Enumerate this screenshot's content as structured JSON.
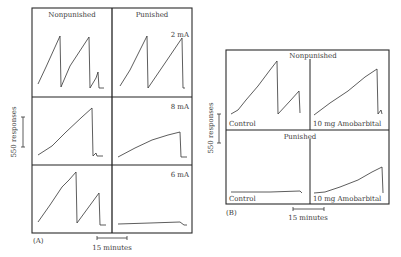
{
  "figure": {
    "panel_a": {
      "tag": "(A)",
      "col_headers": [
        "Nonpunished",
        "Punished"
      ],
      "row_labels": [
        "2 mA",
        "8 mA",
        "6 mA"
      ],
      "y_scale_label": "550 responses",
      "x_scale_label": "15 minutes"
    },
    "panel_b": {
      "tag": "(B)",
      "row_headers": [
        "Nonpunished",
        "Punished"
      ],
      "col_labels": [
        "Control",
        "10 mg Amobarbital"
      ],
      "y_scale_label": "550 responses",
      "x_scale_label": "15 minutes"
    }
  },
  "chart_data": [
    {
      "type": "line",
      "title": "(A) Cumulative response records, nonpunished vs punished at shock intensities",
      "xlabel": "time (scale bar = 15 minutes)",
      "ylabel": "cumulative responses (scale bar = 550 responses)",
      "layout": "3 rows x 2 columns",
      "columns": [
        "Nonpunished",
        "Punished"
      ],
      "rows": [
        "2 mA",
        "8 mA",
        "6 mA"
      ],
      "series": [
        {
          "name": "Nonpunished 2 mA",
          "description": "two full resets plus partial third run",
          "points": [
            [
              38,
              84
            ],
            [
              46,
              67
            ],
            [
              60,
              36
            ],
            [
              61,
              87
            ],
            [
              70,
              66
            ],
            [
              89,
              37
            ],
            [
              90,
              88
            ],
            [
              96,
              78
            ],
            [
              98,
              72
            ],
            [
              99,
              88
            ],
            [
              104,
              88
            ]
          ]
        },
        {
          "name": "Punished 2 mA",
          "description": "one reset then slower climb",
          "points": [
            [
              120,
              86
            ],
            [
              130,
              70
            ],
            [
              147,
              36
            ],
            [
              148,
              88
            ],
            [
              163,
              66
            ],
            [
              182,
              38
            ],
            [
              183,
              88
            ],
            [
              185,
              88
            ]
          ]
        },
        {
          "name": "Nonpunished 8 mA",
          "description": "single steady climb then reset, small blip",
          "points": [
            [
              38,
              155
            ],
            [
              52,
              146
            ],
            [
              66,
              132
            ],
            [
              82,
              117
            ],
            [
              92,
              108
            ],
            [
              93,
              156
            ],
            [
              96,
              153
            ],
            [
              97,
              156
            ],
            [
              103,
              156
            ]
          ]
        },
        {
          "name": "Punished 8 mA",
          "description": "slow steady climb, reset at end",
          "points": [
            [
              118,
              157
            ],
            [
              135,
              148
            ],
            [
              152,
              140
            ],
            [
              168,
              135
            ],
            [
              180,
              132
            ],
            [
              181,
              157
            ],
            [
              187,
              157
            ]
          ]
        },
        {
          "name": "Nonpunished 6 mA",
          "description": "two runs with reset",
          "points": [
            [
              38,
              222
            ],
            [
              50,
              205
            ],
            [
              62,
              187
            ],
            [
              69,
              180
            ],
            [
              76,
              172
            ],
            [
              77,
              223
            ],
            [
              88,
              208
            ],
            [
              99,
              193
            ],
            [
              100,
              225
            ],
            [
              106,
              225
            ]
          ]
        },
        {
          "name": "Punished 6 mA",
          "description": "flat, near-zero responding",
          "points": [
            [
              118,
              224
            ],
            [
              150,
              223
            ],
            [
              180,
              222
            ],
            [
              184,
              225
            ],
            [
              187,
              225
            ]
          ]
        }
      ]
    },
    {
      "type": "line",
      "title": "(B) Cumulative records: Control vs 10 mg Amobarbital",
      "xlabel": "time (scale bar = 15 minutes)",
      "ylabel": "cumulative responses (scale bar = 550 responses)",
      "layout": "2 rows x 2 columns",
      "rows": [
        "Nonpunished",
        "Punished"
      ],
      "columns": [
        "Control",
        "10 mg Amobarbital"
      ],
      "series": [
        {
          "name": "Nonpunished Control",
          "points": [
            [
              231,
              114
            ],
            [
              238,
              110
            ],
            [
              246,
              100
            ],
            [
              258,
              86
            ],
            [
              270,
              70
            ],
            [
              277,
              61
            ],
            [
              278,
              114
            ],
            [
              290,
              101
            ],
            [
              299,
              91
            ],
            [
              300,
              113
            ]
          ]
        },
        {
          "name": "Nonpunished 10 mg Amobarbital",
          "points": [
            [
              314,
              115
            ],
            [
              330,
              103
            ],
            [
              348,
              91
            ],
            [
              365,
              77
            ],
            [
              377,
              69
            ],
            [
              378,
              114
            ],
            [
              381,
              110
            ],
            [
              382,
              114
            ]
          ]
        },
        {
          "name": "Punished Control",
          "description": "flat, near-zero responding",
          "points": [
            [
              231,
              192
            ],
            [
              270,
              192
            ],
            [
              300,
              191
            ],
            [
              302,
              193
            ]
          ]
        },
        {
          "name": "Punished 10 mg Amobarbital",
          "points": [
            [
              314,
              193
            ],
            [
              325,
              192
            ],
            [
              340,
              187
            ],
            [
              358,
              180
            ],
            [
              372,
              172
            ],
            [
              382,
              167
            ],
            [
              383,
              193
            ]
          ]
        }
      ]
    }
  ]
}
